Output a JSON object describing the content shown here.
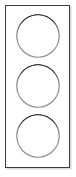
{
  "canvas": {
    "width": 76,
    "height": 177,
    "background_color": "#ffffff",
    "title": "Traffic light"
  },
  "housing": {
    "name": "traffic-light-housing",
    "shape": "rectangle",
    "x": 5,
    "y": 5,
    "width": 65,
    "height": 163,
    "stroke_color": "#3a3a3a",
    "stroke_width": 1,
    "fill_color": "#ffffff",
    "shadow_color": "#d8d8d8"
  },
  "style": {
    "ink_color": "#111111",
    "ink_color_light": "#8d8d8d",
    "stroke_max_width": 4,
    "stroke_min_width": 1,
    "description": "calligraphic ring: heavy at top, hairline at bottom"
  },
  "lamps": [
    {
      "id": "lamp-top",
      "label": "Top lamp",
      "position": "top",
      "state": "off",
      "center_x": 38,
      "center_y": 36,
      "radius": 22,
      "ring_color": "#111111"
    },
    {
      "id": "lamp-middle",
      "label": "Middle lamp",
      "position": "middle",
      "state": "off",
      "center_x": 38,
      "center_y": 86,
      "radius": 22,
      "ring_color": "#111111"
    },
    {
      "id": "lamp-bottom",
      "label": "Bottom lamp",
      "position": "bottom",
      "state": "off",
      "center_x": 38,
      "center_y": 136,
      "radius": 22,
      "ring_color": "#111111"
    }
  ],
  "caption": "Traffic light with three unlit circular lamps"
}
